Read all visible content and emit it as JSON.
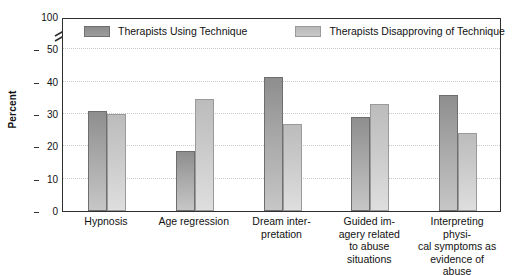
{
  "chart_data": {
    "type": "bar",
    "title": "",
    "subtitle": "",
    "xlabel": "",
    "ylabel": "Percent",
    "ylim": [
      0,
      100
    ],
    "y_ticks": [
      0,
      10,
      20,
      30,
      40,
      50,
      100
    ],
    "y_axis_break": true,
    "y_axis_break_note": "axis broken between 50 and 100",
    "grid": true,
    "grid_axis": "y",
    "legend_position": "top-inside",
    "categories": [
      "Hypnosis",
      "Age regression",
      "Dream interpretation",
      "Guided imagery related to abuse situations",
      "Interpreting physical symptoms as evidence of abuse"
    ],
    "category_label_lines": [
      [
        "Hypnosis"
      ],
      [
        "Age regression"
      ],
      [
        "Dream inter-",
        "pretation"
      ],
      [
        "Guided im-",
        "agery related",
        "to abuse",
        "situations"
      ],
      [
        "Interpreting physi-",
        "cal symptoms as",
        "evidence of abuse"
      ]
    ],
    "series": [
      {
        "name": "Therapists Using Technique",
        "color": "#9d9d9d",
        "values": [
          31,
          18.5,
          41.5,
          29,
          36
        ]
      },
      {
        "name": "Therapists Disapproving of Technique",
        "color": "#c8c8c8",
        "values": [
          30,
          34.5,
          27,
          33,
          24
        ]
      }
    ]
  },
  "legend": {
    "entries": [
      {
        "label": "Therapists Using Technique",
        "swatch": "dark"
      },
      {
        "label": "Therapists Disapproving of Technique",
        "swatch": "light"
      }
    ]
  },
  "axes": {
    "y_title": "Percent",
    "y_tick_labels": [
      "100",
      "50",
      "40",
      "30",
      "20",
      "10",
      "0"
    ]
  },
  "colors": {
    "series_dark": "#9d9d9d",
    "series_light": "#c8c8c8",
    "frame": "#2f2f2f",
    "gridline": "#c9c9c9",
    "text": "#111111",
    "background": "#ffffff"
  }
}
